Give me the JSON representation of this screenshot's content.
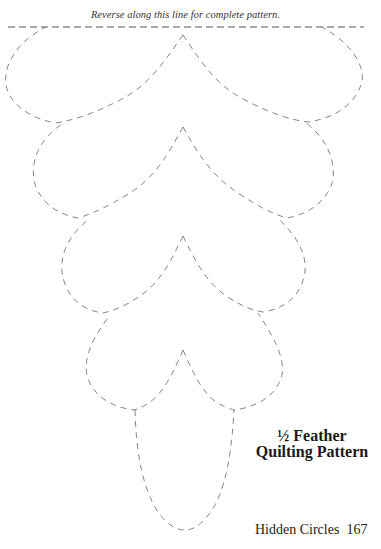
{
  "document": {
    "caption": "Reverse along this line for complete pattern.",
    "title_line1": "½ Feather",
    "title_line2": "Quilting Pattern",
    "footer": {
      "book_title": "Hidden Circles",
      "page_number": "167"
    }
  },
  "pattern": {
    "type": "half feather quilting stencil",
    "line_style": "dashed",
    "line_color": "#777777",
    "fold_line_color": "#555555",
    "feather_rows": 4,
    "end_shape": "teardrop"
  }
}
